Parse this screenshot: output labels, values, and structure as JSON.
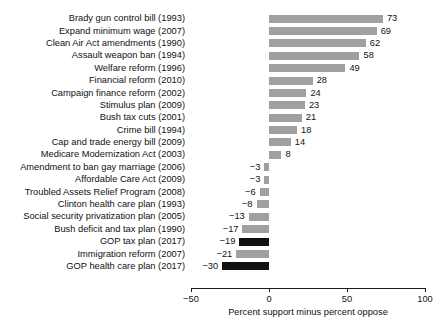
{
  "chart_data": {
    "type": "bar",
    "orientation": "horizontal",
    "title": "",
    "subtitle": "",
    "xlabel": "Percent support minus percent oppose",
    "ylabel": "",
    "xlim": [
      -50,
      100
    ],
    "xticks": [
      -50,
      0,
      50,
      100
    ],
    "xticklabels": [
      "−50",
      "0",
      "50",
      "100"
    ],
    "grid": false,
    "legend": "none",
    "categories": [
      "Brady gun control bill (1993)",
      "Expand minimum wage (2007)",
      "Clean Air Act amendments (1990)",
      "Assault weapon ban (1994)",
      "Welfare reform (1996)",
      "Financial reform (2010)",
      "Campaign finance reform (2002)",
      "Stimulus plan (2009)",
      "Bush tax cuts (2001)",
      "Crime bill (1994)",
      "Cap and trade energy bill (2009)",
      "Medicare Modernization Act (2003)",
      "Amendment to ban gay marriage (2006)",
      "Affordable Care Act (2009)",
      "Troubled Assets Relief Program (2008)",
      "Clinton health care plan (1993)",
      "Social security privatization plan (2005)",
      "Bush deficit and tax plan (1990)",
      "GOP tax plan (2017)",
      "Immigration reform (2007)",
      "GOP health care plan (2017)"
    ],
    "values": [
      73,
      69,
      62,
      58,
      49,
      28,
      24,
      23,
      21,
      18,
      14,
      8,
      -3,
      -3,
      -6,
      -8,
      -13,
      -17,
      -19,
      -21,
      -30
    ],
    "value_labels": [
      "73",
      "69",
      "62",
      "58",
      "49",
      "28",
      "24",
      "23",
      "21",
      "18",
      "14",
      "8",
      "−3",
      "−3",
      "−6",
      "−8",
      "−13",
      "−17",
      "−19",
      "−21",
      "−30"
    ],
    "highlighted": [
      false,
      false,
      false,
      false,
      false,
      false,
      false,
      false,
      false,
      false,
      false,
      false,
      false,
      false,
      false,
      false,
      false,
      false,
      true,
      false,
      true
    ],
    "colors": {
      "bar_default": "#a0a0a0",
      "bar_highlight": "#111111",
      "axis": "#1a1a1a",
      "text": "#111111",
      "background": "#ffffff"
    }
  }
}
